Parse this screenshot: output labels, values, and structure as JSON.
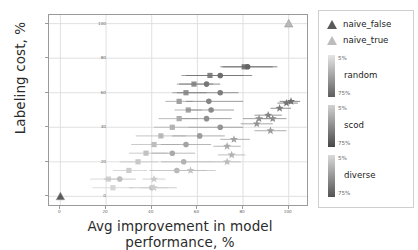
{
  "chart_data": {
    "type": "scatter",
    "title": "",
    "xlabel": "Avg improvement in model performance, %",
    "ylabel": "Labeling cost, %",
    "xlim": [
      -5,
      108
    ],
    "ylim": [
      -5,
      105
    ],
    "xticks": [
      0,
      20,
      40,
      60,
      80,
      100
    ],
    "yticks": [
      0,
      20,
      40,
      60,
      80,
      100
    ],
    "grid": true,
    "legend_position": "right-outside",
    "series": [
      {
        "name": "naive_false",
        "marker": "triangle",
        "color": "#5a5a5a",
        "points": [
          {
            "x": 0,
            "y": 0,
            "xerr_low": 0,
            "xerr_high": 0
          }
        ]
      },
      {
        "name": "naive_true",
        "marker": "triangle",
        "color": "#b9b9b9",
        "points": [
          {
            "x": 100,
            "y": 100,
            "xerr_low": 0,
            "xerr_high": 0
          }
        ]
      },
      {
        "name": "random",
        "marker": "square",
        "cmin_label": "5%",
        "cmax_label": "75%",
        "color_low": "#e2e2e2",
        "color_high": "#5e5e5e",
        "points": [
          {
            "x": 80.5,
            "y": 75,
            "xerr_low": 70,
            "xerr_high": 93,
            "shade": 0.78
          },
          {
            "x": 65.5,
            "y": 70,
            "xerr_low": 53,
            "xerr_high": 80,
            "shade": 0.72
          },
          {
            "x": 58.5,
            "y": 65,
            "xerr_low": 51,
            "xerr_high": 67,
            "shade": 0.62
          },
          {
            "x": 55,
            "y": 60,
            "xerr_low": 49,
            "xerr_high": 64,
            "shade": 0.6
          },
          {
            "x": 52,
            "y": 55,
            "xerr_low": 46,
            "xerr_high": 58,
            "shade": 0.5
          },
          {
            "x": 56,
            "y": 50,
            "xerr_low": 50,
            "xerr_high": 62,
            "shade": 0.46
          },
          {
            "x": 52,
            "y": 45,
            "xerr_low": 43,
            "xerr_high": 60,
            "shade": 0.4
          },
          {
            "x": 49,
            "y": 40,
            "xerr_low": 41,
            "xerr_high": 56,
            "shade": 0.36
          },
          {
            "x": 44,
            "y": 35,
            "xerr_low": 33,
            "xerr_high": 55,
            "shade": 0.32
          },
          {
            "x": 41,
            "y": 30,
            "xerr_low": 31,
            "xerr_high": 52,
            "shade": 0.28
          },
          {
            "x": 37.5,
            "y": 25,
            "xerr_low": 30,
            "xerr_high": 47,
            "shade": 0.24
          },
          {
            "x": 34,
            "y": 20,
            "xerr_low": 26,
            "xerr_high": 43,
            "shade": 0.2
          },
          {
            "x": 30,
            "y": 15,
            "xerr_low": 23,
            "xerr_high": 38,
            "shade": 0.16
          },
          {
            "x": 21,
            "y": 10,
            "xerr_low": 13,
            "xerr_high": 27,
            "shade": 0.12
          },
          {
            "x": 23,
            "y": 5,
            "xerr_low": 14,
            "xerr_high": 32,
            "shade": 0.1
          }
        ]
      },
      {
        "name": "scod",
        "marker": "circle",
        "cmin_label": "5%",
        "cmax_label": "75%",
        "color_low": "#cfcfcf",
        "color_high": "#4a4a4a",
        "points": [
          {
            "x": 82,
            "y": 75,
            "xerr_low": 71,
            "xerr_high": 95,
            "shade": 0.8
          },
          {
            "x": 70,
            "y": 70,
            "xerr_low": 55,
            "xerr_high": 84,
            "shade": 0.74
          },
          {
            "x": 64,
            "y": 65,
            "xerr_low": 52,
            "xerr_high": 70,
            "shade": 0.66
          },
          {
            "x": 70,
            "y": 60,
            "xerr_low": 51,
            "xerr_high": 78,
            "shade": 0.62
          },
          {
            "x": 65,
            "y": 55,
            "xerr_low": 55,
            "xerr_high": 80,
            "shade": 0.56
          },
          {
            "x": 66,
            "y": 50,
            "xerr_low": 55,
            "xerr_high": 76,
            "shade": 0.52
          },
          {
            "x": 64,
            "y": 45,
            "xerr_low": 53,
            "xerr_high": 75,
            "shade": 0.48
          },
          {
            "x": 70,
            "y": 40,
            "xerr_low": 56,
            "xerr_high": 80,
            "shade": 0.44
          },
          {
            "x": 61,
            "y": 35,
            "xerr_low": 49,
            "xerr_high": 72,
            "shade": 0.38
          },
          {
            "x": 55,
            "y": 30,
            "xerr_low": 44,
            "xerr_high": 66,
            "shade": 0.32
          },
          {
            "x": 49,
            "y": 25,
            "xerr_low": 40,
            "xerr_high": 59,
            "shade": 0.28
          },
          {
            "x": 54,
            "y": 20,
            "xerr_low": 44,
            "xerr_high": 67,
            "shade": 0.22
          },
          {
            "x": 51,
            "y": 15,
            "xerr_low": 39,
            "xerr_high": 64,
            "shade": 0.18
          },
          {
            "x": 26,
            "y": 10,
            "xerr_low": 19,
            "xerr_high": 33,
            "shade": 0.12
          },
          {
            "x": 40,
            "y": 5,
            "xerr_low": 30,
            "xerr_high": 51,
            "shade": 0.08
          }
        ]
      },
      {
        "name": "diverse",
        "marker": "star",
        "cmin_label": "5%",
        "cmax_label": "75%",
        "color_low": "#d6d6d6",
        "color_high": "#555555",
        "points": [
          {
            "x": 101,
            "y": 55,
            "xerr_low": 96,
            "xerr_high": 105,
            "shade": 0.8
          },
          {
            "x": 99,
            "y": 54,
            "xerr_low": 95,
            "xerr_high": 104,
            "shade": 0.76
          },
          {
            "x": 96,
            "y": 51,
            "xerr_low": 92,
            "xerr_high": 101,
            "shade": 0.7
          },
          {
            "x": 91,
            "y": 47,
            "xerr_low": 85,
            "xerr_high": 97,
            "shade": 0.64
          },
          {
            "x": 93,
            "y": 45,
            "xerr_low": 88,
            "xerr_high": 99,
            "shade": 0.6
          },
          {
            "x": 87,
            "y": 45,
            "xerr_low": 80,
            "xerr_high": 94,
            "shade": 0.56
          },
          {
            "x": 86,
            "y": 42,
            "xerr_low": 79,
            "xerr_high": 93,
            "shade": 0.52
          },
          {
            "x": 92,
            "y": 38,
            "xerr_low": 85,
            "xerr_high": 99,
            "shade": 0.46
          },
          {
            "x": 76,
            "y": 33,
            "xerr_low": 70,
            "xerr_high": 83,
            "shade": 0.4
          },
          {
            "x": 73,
            "y": 29,
            "xerr_low": 67,
            "xerr_high": 79,
            "shade": 0.34
          },
          {
            "x": 75,
            "y": 24,
            "xerr_low": 69,
            "xerr_high": 81,
            "shade": 0.28
          },
          {
            "x": 73,
            "y": 20,
            "xerr_low": 67,
            "xerr_high": 79,
            "shade": 0.22
          },
          {
            "x": 57,
            "y": 15,
            "xerr_low": 49,
            "xerr_high": 68,
            "shade": 0.16
          },
          {
            "x": 41,
            "y": 10,
            "xerr_low": 36,
            "xerr_high": 46,
            "shade": 0.1
          },
          {
            "x": 41,
            "y": 5,
            "xerr_low": 35,
            "xerr_high": 47,
            "shade": 0.06
          }
        ]
      }
    ]
  },
  "axes": {
    "xlabel": "Avg improvement in model performance, %",
    "ylabel": "Labeling cost, %",
    "xticks": [
      "0",
      "20",
      "40",
      "60",
      "80",
      "100"
    ],
    "yticks": [
      "0",
      "20",
      "40",
      "60",
      "80",
      "100"
    ]
  },
  "legend": {
    "entries": [
      {
        "label": "naive_false",
        "marker": "triangle",
        "color": "#5a5a5a"
      },
      {
        "label": "naive_true",
        "marker": "triangle",
        "color": "#bcbcbc"
      }
    ],
    "colorbars": [
      {
        "name": "random",
        "min_label": "5%",
        "max_label": "75%"
      },
      {
        "name": "scod",
        "min_label": "5%",
        "max_label": "75%"
      },
      {
        "name": "diverse",
        "min_label": "5%",
        "max_label": "75%"
      }
    ]
  }
}
